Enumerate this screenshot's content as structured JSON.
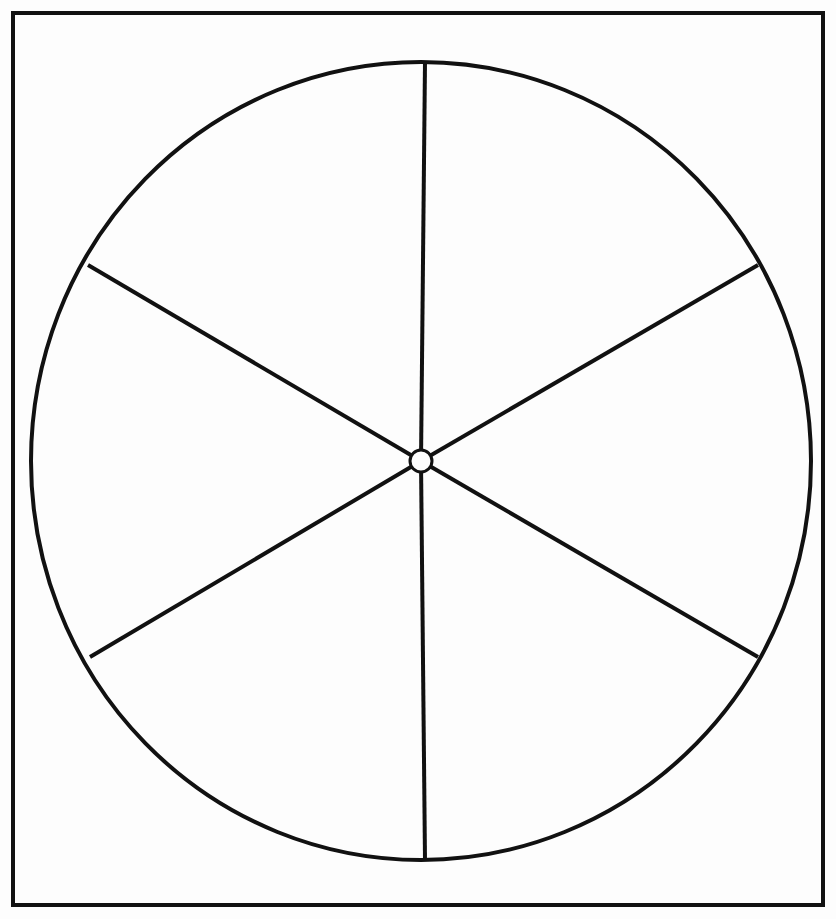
{
  "page": {
    "background_color": "#fdfdfd",
    "width": 836,
    "height": 919
  },
  "frame": {
    "name": "outer-border-frame",
    "stroke_color": "#111111",
    "stroke_width": 4,
    "x": 13,
    "y": 13,
    "width": 810,
    "height": 892
  },
  "wheel": {
    "rim": {
      "label": "wheel-rim",
      "center_x": 421,
      "center_y": 461,
      "radius_x": 390,
      "radius_y": 399,
      "stroke_color": "#111111",
      "stroke_width": 4,
      "fill": "none"
    },
    "hub": {
      "label": "wheel-hub",
      "center_x": 421,
      "center_y": 461,
      "radius": 11,
      "stroke_color": "#111111",
      "stroke_width": 3,
      "fill_color": "#fdfdfd"
    },
    "spoke_count": 6,
    "spoke_stroke_color": "#111111",
    "spoke_stroke_width": 4,
    "spokes": [
      {
        "label": "spoke-top",
        "angle_deg": 90,
        "x1": 425,
        "y1": 62,
        "x2": 421,
        "y2": 461
      },
      {
        "label": "spoke-upper-right",
        "angle_deg": 30,
        "x1": 758,
        "y1": 265,
        "x2": 421,
        "y2": 461
      },
      {
        "label": "spoke-lower-right",
        "angle_deg": -30,
        "x1": 758,
        "y1": 657,
        "x2": 421,
        "y2": 461
      },
      {
        "label": "spoke-bottom",
        "angle_deg": -90,
        "x1": 425,
        "y1": 860,
        "x2": 421,
        "y2": 461
      },
      {
        "label": "spoke-lower-left",
        "angle_deg": -150,
        "x1": 90,
        "y1": 657,
        "x2": 421,
        "y2": 461
      },
      {
        "label": "spoke-upper-left",
        "angle_deg": 150,
        "x1": 88,
        "y1": 265,
        "x2": 421,
        "y2": 461
      }
    ]
  },
  "chart_data": {
    "type": "pie",
    "title": "",
    "subtitle": "",
    "xlabel": "",
    "ylabel": "",
    "legend_position": "none",
    "grid": false,
    "categories": [
      "Sector 1",
      "Sector 2",
      "Sector 3",
      "Sector 4",
      "Sector 5",
      "Sector 6"
    ],
    "values": [
      60,
      60,
      60,
      60,
      60,
      60
    ],
    "units": "degrees",
    "slice_fill": "none",
    "slice_stroke": "#111111",
    "annotations": []
  }
}
